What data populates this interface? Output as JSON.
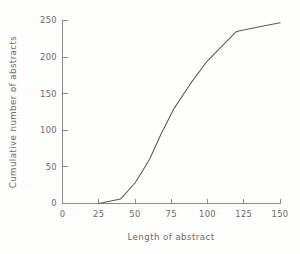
{
  "chart_data": {
    "type": "line",
    "title": "",
    "xlabel": "Length of abstract",
    "ylabel": "Cumulative number of abstracts",
    "xlim": [
      0,
      150
    ],
    "ylim": [
      0,
      250
    ],
    "grid": false,
    "legend": false,
    "xticks": [
      0,
      25,
      50,
      75,
      100,
      125,
      150
    ],
    "xtick_labels": [
      "0",
      "25",
      "50",
      "75",
      "100",
      "125",
      "150"
    ],
    "yticks": [
      0,
      50,
      100,
      150,
      200,
      250
    ],
    "ytick_labels": [
      "0",
      "50",
      "100",
      "150",
      "200",
      "250"
    ],
    "series": [
      {
        "name": "Cumulative abstracts",
        "color": "#5a5a5a",
        "x": [
          25,
          40,
          50,
          60,
          68,
          77,
          88,
          100,
          110,
          120,
          135,
          150
        ],
        "y": [
          0,
          6,
          28,
          60,
          95,
          130,
          163,
          195,
          215,
          235,
          241,
          247
        ]
      }
    ]
  },
  "axes": {
    "x_title": "Length of abstract",
    "y_title": "Cumulative number of abstracts"
  },
  "ticks": {
    "x": [
      "0",
      "25",
      "50",
      "75",
      "100",
      "125",
      "150"
    ],
    "y": [
      "0",
      "50",
      "100",
      "150",
      "200",
      "250"
    ]
  },
  "style": {
    "line_color": "#5a5a5a",
    "axis_color": "#8c8c8c",
    "text_color": "#6b6b6b",
    "background": "#fdfdfc"
  }
}
